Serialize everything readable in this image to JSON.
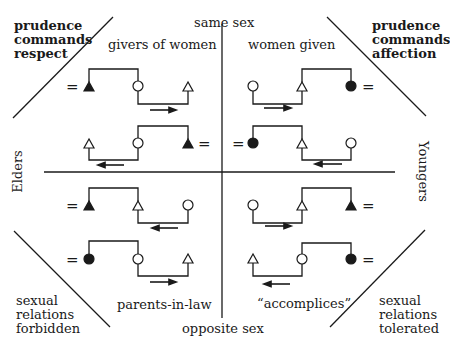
{
  "axes": {
    "top": "same sex",
    "bottom": "opposite sex",
    "left": "Elders",
    "right": "Youngers"
  },
  "quadrants": {
    "top_left": "givers of women",
    "top_right": "women given",
    "bottom_left": "parents-in-law",
    "bottom_right": "“accomplices”"
  },
  "corners": {
    "top_left": [
      "prudence",
      "commands",
      "respect"
    ],
    "top_right": [
      "prudence",
      "commands",
      "affection"
    ],
    "bottom_left": [
      "sexual",
      "relations",
      "forbidden"
    ],
    "bottom_right": [
      "sexual",
      "relations",
      "tolerated"
    ]
  },
  "symbols": {
    "equals": "="
  },
  "colors": {
    "ink": "#1a1a1a",
    "background": "#ffffff"
  }
}
